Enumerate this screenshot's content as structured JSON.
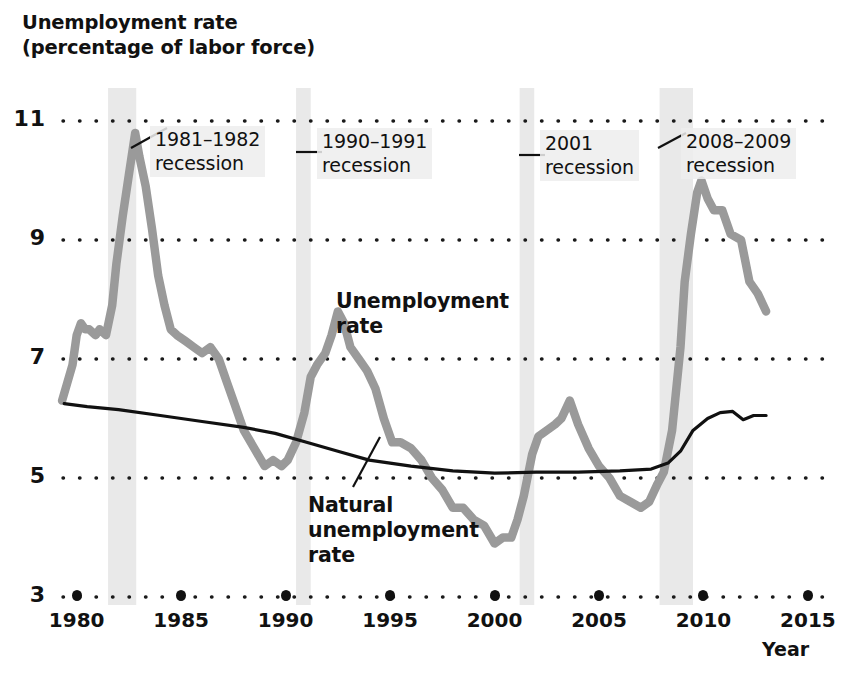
{
  "figure": {
    "y_axis_title": "Unemployment rate\n(percentage of labor force)",
    "x_axis_title": "Year"
  },
  "chart_data": {
    "type": "line",
    "title": "Unemployment rate (percentage of labor force)",
    "xlabel": "Year",
    "ylabel": "Unemployment rate (percentage of labor force)",
    "xlim": [
      1979.2,
      2016.2
    ],
    "ylim": [
      3,
      11
    ],
    "xticks": [
      1980,
      1985,
      1990,
      1995,
      2000,
      2005,
      2010,
      2015
    ],
    "yticks": [
      3,
      5,
      7,
      9,
      11
    ],
    "grid": "horizontal-dotted",
    "legend": "inline-labels",
    "series": [
      {
        "name": "Unemployment rate",
        "color": "#9a9a9a",
        "x": [
          1979.3,
          1979.8,
          1980.0,
          1980.2,
          1980.4,
          1980.6,
          1980.9,
          1981.1,
          1981.4,
          1981.7,
          1981.9,
          1982.2,
          1982.5,
          1982.8,
          1983.0,
          1983.3,
          1983.6,
          1983.9,
          1984.2,
          1984.5,
          1984.8,
          1985.2,
          1985.6,
          1986.0,
          1986.4,
          1986.8,
          1987.2,
          1987.6,
          1988.0,
          1988.5,
          1989.0,
          1989.4,
          1989.8,
          1990.1,
          1990.5,
          1990.9,
          1991.2,
          1991.5,
          1991.9,
          1992.2,
          1992.5,
          1992.8,
          1993.1,
          1993.5,
          1993.9,
          1994.3,
          1994.7,
          1995.1,
          1995.5,
          1996.0,
          1996.5,
          1997.0,
          1997.5,
          1998.0,
          1998.5,
          1999.0,
          1999.5,
          2000.0,
          2000.4,
          2000.8,
          2001.1,
          2001.4,
          2001.8,
          2002.1,
          2002.5,
          2002.9,
          2003.2,
          2003.6,
          2004.0,
          2004.5,
          2005.0,
          2005.5,
          2006.0,
          2006.5,
          2007.0,
          2007.4,
          2007.8,
          2008.1,
          2008.5,
          2008.9,
          2009.1,
          2009.4,
          2009.7,
          2009.9,
          2010.2,
          2010.5,
          2010.9,
          2011.3,
          2011.8,
          2012.2,
          2012.6,
          2013.0
        ],
        "y": [
          6.3,
          6.9,
          7.4,
          7.6,
          7.5,
          7.5,
          7.4,
          7.5,
          7.4,
          7.9,
          8.6,
          9.4,
          10.1,
          10.8,
          10.4,
          9.9,
          9.2,
          8.4,
          7.9,
          7.5,
          7.4,
          7.3,
          7.2,
          7.1,
          7.2,
          7.0,
          6.6,
          6.2,
          5.8,
          5.5,
          5.2,
          5.3,
          5.2,
          5.3,
          5.6,
          6.1,
          6.7,
          6.9,
          7.1,
          7.4,
          7.8,
          7.6,
          7.2,
          7.0,
          6.8,
          6.5,
          6.0,
          5.6,
          5.6,
          5.5,
          5.3,
          5.0,
          4.8,
          4.5,
          4.5,
          4.3,
          4.2,
          3.9,
          4.0,
          4.0,
          4.3,
          4.7,
          5.4,
          5.7,
          5.8,
          5.9,
          6.0,
          6.3,
          5.9,
          5.5,
          5.2,
          5.0,
          4.7,
          4.6,
          4.5,
          4.6,
          4.9,
          5.1,
          5.8,
          7.2,
          8.3,
          9.1,
          9.8,
          10.0,
          9.7,
          9.5,
          9.5,
          9.1,
          9.0,
          8.3,
          8.1,
          7.8
        ]
      },
      {
        "name": "Natural unemployment rate",
        "color": "#111111",
        "x": [
          1979.4,
          1980.5,
          1982.0,
          1984.0,
          1986.0,
          1988.0,
          1989.5,
          1991.0,
          1992.5,
          1994.0,
          1996.0,
          1998.0,
          2000.0,
          2002.0,
          2004.0,
          2006.0,
          2007.5,
          2008.3,
          2008.9,
          2009.5,
          2010.2,
          2010.8,
          2011.4,
          2011.9,
          2012.4,
          2013.0
        ],
        "y": [
          6.25,
          6.2,
          6.15,
          6.05,
          5.95,
          5.85,
          5.75,
          5.6,
          5.45,
          5.3,
          5.2,
          5.12,
          5.08,
          5.1,
          5.1,
          5.12,
          5.15,
          5.25,
          5.45,
          5.8,
          6.0,
          6.1,
          6.12,
          5.98,
          6.05,
          6.05
        ]
      }
    ],
    "shaded_bands": [
      {
        "label": "1981–1982 recession",
        "x_start": 1981.5,
        "x_end": 1982.85
      },
      {
        "label": "1990–1991 recession",
        "x_start": 1990.5,
        "x_end": 1991.2
      },
      {
        "label": "2001 recession",
        "x_start": 2001.2,
        "x_end": 2001.9
      },
      {
        "label": "2008–2009 recession",
        "x_start": 2007.9,
        "x_end": 2009.5
      }
    ],
    "annotations": [
      {
        "name": "recession-1981-1982",
        "text": "1981–1982\nrecession"
      },
      {
        "name": "recession-1990-1991",
        "text": "1990–1991\nrecession"
      },
      {
        "name": "recession-2001",
        "text": "2001\nrecession"
      },
      {
        "name": "recession-2008-2009",
        "text": "2008–2009\nrecession"
      },
      {
        "name": "unemployment-rate-label",
        "text": "Unemployment\nrate"
      },
      {
        "name": "natural-unemployment-rate-label",
        "text": "Natural\nunemployment\nrate"
      }
    ]
  },
  "yticks": [
    {
      "label": "11",
      "value": 11
    },
    {
      "label": "9",
      "value": 9
    },
    {
      "label": "7",
      "value": 7
    },
    {
      "label": "5",
      "value": 5
    },
    {
      "label": "3",
      "value": 3
    }
  ],
  "xticks": [
    {
      "label": "1980"
    },
    {
      "label": "1985"
    },
    {
      "label": "1990"
    },
    {
      "label": "1995"
    },
    {
      "label": "2000"
    },
    {
      "label": "2005"
    },
    {
      "label": "2010"
    },
    {
      "label": "2015"
    }
  ],
  "callouts": {
    "r1": "1981–1982\nrecession",
    "r2": "1990–1991\nrecession",
    "r3": "2001\nrecession",
    "r4": "2008–2009\nrecession"
  },
  "series_labels": {
    "unemployment": "Unemployment\nrate",
    "natural": "Natural\nunemployment\nrate"
  },
  "colors": {
    "unemployment_line": "#9a9a9a",
    "natural_line": "#111111",
    "recession_band": "#e9e9e9",
    "gridline": "#1a1a1a",
    "background": "#ffffff"
  }
}
